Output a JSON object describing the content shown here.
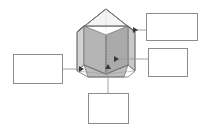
{
  "diagram": {
    "shape_name": "pentagonal-prism",
    "background_color": "#ffffff",
    "colors": {
      "outline": "#6e6e6e",
      "hidden_edge": "#b9b9b9",
      "top_face": "#f2f2f2",
      "front_left_face": "#b5b5b5",
      "front_right_face": "#a8a8a8",
      "side_face": "#cfcfcf",
      "bottom_face": "#bdbdbd",
      "box_border": "#8c8c8c",
      "connector": "#9a9a9a"
    },
    "label_boxes": [
      {
        "id": "box-top-right",
        "text": "",
        "x": 146,
        "y": 13,
        "w": 52,
        "h": 28
      },
      {
        "id": "box-middle-right",
        "text": "",
        "x": 148,
        "y": 48,
        "w": 40,
        "h": 29
      },
      {
        "id": "box-left",
        "text": "",
        "x": 13,
        "y": 54,
        "w": 50,
        "h": 30
      },
      {
        "id": "box-bottom",
        "text": "",
        "x": 88,
        "y": 93,
        "w": 41,
        "h": 31
      }
    ],
    "connectors": [
      {
        "id": "connector-top-right",
        "from_box": "box-top-right",
        "points_to": "prism-right-side-face",
        "arrow_direction": "left"
      },
      {
        "id": "connector-middle-right",
        "from_box": "box-middle-right",
        "points_to": "prism-front-right-face",
        "arrow_direction": "left"
      },
      {
        "id": "connector-left",
        "from_box": "box-left",
        "points_to": "prism-front-left-face",
        "arrow_direction": "right"
      },
      {
        "id": "connector-bottom",
        "from_box": "box-bottom",
        "points_to": "prism-base-face",
        "arrow_direction": "up"
      }
    ]
  }
}
